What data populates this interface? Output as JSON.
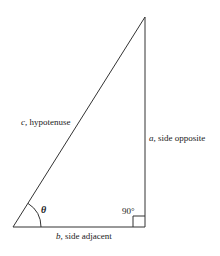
{
  "figure": {
    "type": "right-triangle",
    "vertices": {
      "apex": [
        145,
        17
      ],
      "angle_vertex": [
        13,
        227
      ],
      "right_angle_vertex": [
        145,
        227
      ]
    },
    "stroke_color": "#333333",
    "labels": {
      "hypotenuse": {
        "var": "c",
        "sep": ", ",
        "text": "hypotenuse"
      },
      "opposite": {
        "var": "a",
        "sep": ", ",
        "text": "side opposite"
      },
      "adjacent": {
        "var": "b",
        "sep": ", ",
        "text": "side adjacent"
      },
      "right_angle": "90°",
      "angle": "θ"
    }
  }
}
